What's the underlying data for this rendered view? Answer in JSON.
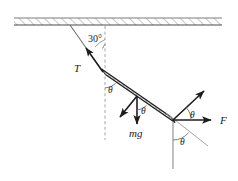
{
  "figure": {
    "background_color": "#ffffff",
    "line_color": "#222222",
    "guide_color": "#8a8a8a",
    "hatch_color": "#9a9a9a",
    "width": 238,
    "height": 181
  },
  "labels": {
    "angle_ceiling": "30°",
    "tension": "T",
    "weight": "mg",
    "force": "F",
    "theta_rod_top": "θ",
    "theta_rod_mid": "θ",
    "theta_force_upper": "θ",
    "theta_force_lower": "θ"
  },
  "elements": {
    "ceiling_name": "ceiling-support",
    "string_name": "tension-string",
    "rod_name": "rigid-rod",
    "weight_arrow_name": "weight-vector",
    "perp_arrow_name": "perpendicular-component-vector",
    "force_arrow_name": "applied-force-vector",
    "reaction_arrow_name": "reaction-vector",
    "vertical_ref_name": "vertical-reference-line",
    "incline_ref_name": "incline-reference-line"
  },
  "geometry": {
    "ceiling_y": 18,
    "ceiling_thickness": 7,
    "string_top": [
      70,
      25
    ],
    "rod_left": [
      103,
      72
    ],
    "rod_right": [
      173,
      120
    ],
    "rod_center": [
      137,
      96
    ],
    "mg_tip": [
      137,
      126
    ],
    "force_tip": [
      212,
      120
    ],
    "reaction_tip": [
      205,
      90
    ]
  }
}
